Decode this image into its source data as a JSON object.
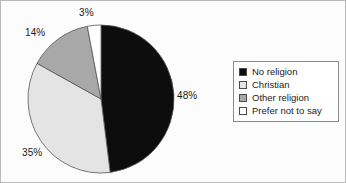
{
  "chart_data": {
    "type": "pie",
    "title": "",
    "categories": [
      "No religion",
      "Christian",
      "Other religion",
      "Prefer not to say"
    ],
    "values": [
      48,
      35,
      14,
      3
    ],
    "value_labels": [
      "48%",
      "35%",
      "14%",
      "3%"
    ],
    "units": "percent",
    "start_angle_deg": 0,
    "direction": "clockwise",
    "colors": [
      "#0d0d0d",
      "#e4e4e4",
      "#a8a8a8",
      "#ffffff"
    ],
    "slice_border_color": "#555555",
    "legend": {
      "position": "right",
      "border_color": "#8a8a8a",
      "entries": [
        {
          "label": "No religion",
          "color": "#0d0d0d",
          "value": 48
        },
        {
          "label": "Christian",
          "color": "#e4e4e4",
          "value": 35
        },
        {
          "label": "Other religion",
          "color": "#a8a8a8",
          "value": 14
        },
        {
          "label": "Prefer not to say",
          "color": "#ffffff",
          "value": 3
        }
      ]
    },
    "grid": false,
    "xlabel": "",
    "ylabel": ""
  }
}
